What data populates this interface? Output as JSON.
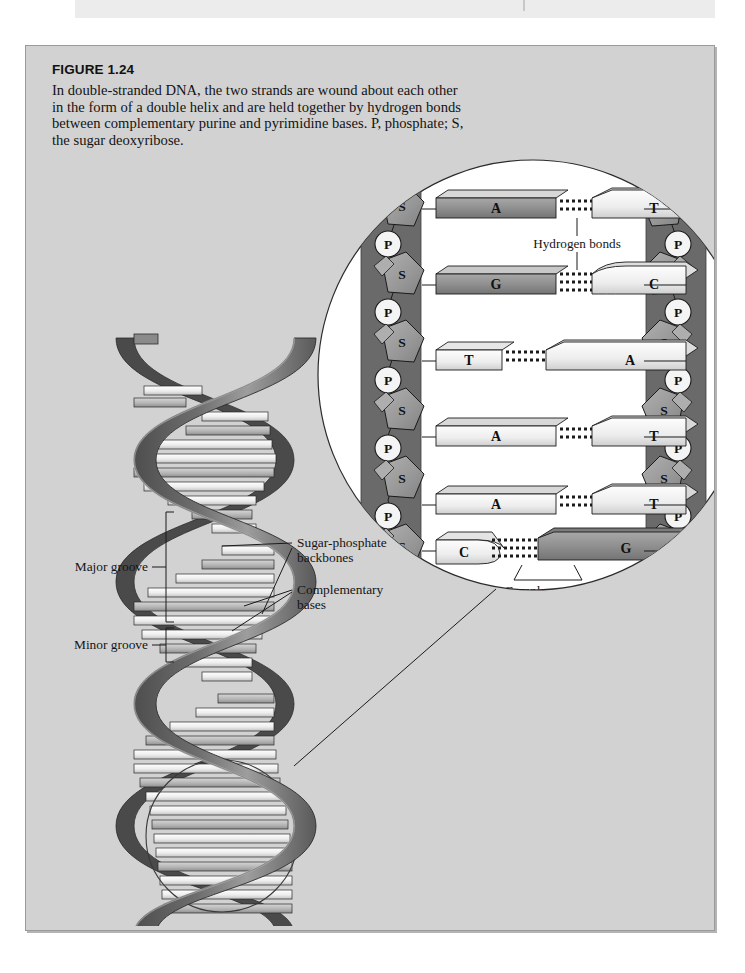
{
  "figure": {
    "number_label": "FIGURE 1.24",
    "caption": "In double-stranded DNA, the two strands are wound about each other in the form of a double helix and are held together by hydrogen bonds between complementary purine and pyrimidine bases. P, phosphate; S, the sugar deoxyribose."
  },
  "helix_labels": {
    "major_groove": "Major groove",
    "minor_groove": "Minor groove",
    "sugar_phosphate": "Sugar-phosphate",
    "sugar_phosphate_line2": "backbones",
    "complementary": "Complementary",
    "complementary_line2": "bases"
  },
  "inset_labels": {
    "hydrogen_bonds": "Hydrogen bonds",
    "complementary": "Complementary",
    "complementary_line2": "bases"
  },
  "inset": {
    "sugar_symbol": "S",
    "phosphate_symbol": "P",
    "base_pairs": [
      {
        "left": "A",
        "right": "T",
        "left_type": "purine",
        "right_type": "pyrimidine",
        "bonds": 2
      },
      {
        "left": "G",
        "right": "C",
        "left_type": "purine",
        "right_type": "pyrimidine",
        "bonds": 3
      },
      {
        "left": "T",
        "right": "A",
        "left_type": "pyrimidine",
        "right_type": "purine",
        "bonds": 2
      },
      {
        "left": "A",
        "right": "T",
        "left_type": "purine",
        "right_type": "pyrimidine",
        "bonds": 2
      },
      {
        "left": "A",
        "right": "T",
        "left_type": "purine",
        "right_type": "pyrimidine",
        "bonds": 2
      },
      {
        "left": "C",
        "right": "G",
        "left_type": "pyrimidine",
        "right_type": "purine",
        "bonds": 3
      }
    ],
    "sugar_count_per_strand": 6,
    "phosphate_count_per_strand": 5
  },
  "colors": {
    "panel_background": "#d2d2d2",
    "page_background": "#ffffff",
    "inset_fill": "#ffffff",
    "backbone_dark": "#6a6a6a",
    "backbone_edge": "#4a4a4a",
    "sugar_fill": "#9a9a9a",
    "phosphate_fill": "#f4f4f4",
    "purine_fill": "#8d8d8d",
    "pyrimidine_fill": "#ededed",
    "ribbon_dark": "#585858",
    "ribbon_light": "#a8a8a8",
    "rung_light": "#efefef",
    "rung_mid": "#b9b9b9",
    "outline": "#1b1b1b"
  }
}
